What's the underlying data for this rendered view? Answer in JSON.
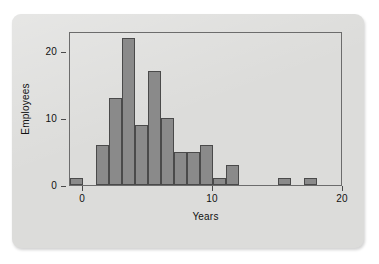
{
  "chart_data": {
    "type": "bar",
    "title": "",
    "subtitle": "",
    "xlabel": "Years",
    "ylabel": "Employees",
    "xlim": [
      -1,
      20
    ],
    "ylim": [
      0,
      23
    ],
    "grid": false,
    "legend": null,
    "bin_width": 1,
    "x_ticks": [
      {
        "value": 0,
        "label": "0"
      },
      {
        "value": 10,
        "label": "10"
      },
      {
        "value": 20,
        "label": "20"
      }
    ],
    "y_ticks": [
      {
        "value": 0,
        "label": "0"
      },
      {
        "value": 10,
        "label": "10"
      },
      {
        "value": 20,
        "label": "20"
      }
    ],
    "bins": [
      {
        "x0": -1,
        "x1": 0,
        "count": 1
      },
      {
        "x0": 1,
        "x1": 2,
        "count": 6
      },
      {
        "x0": 2,
        "x1": 3,
        "count": 13
      },
      {
        "x0": 3,
        "x1": 4,
        "count": 22
      },
      {
        "x0": 4,
        "x1": 5,
        "count": 9
      },
      {
        "x0": 5,
        "x1": 6,
        "count": 17
      },
      {
        "x0": 6,
        "x1": 7,
        "count": 10
      },
      {
        "x0": 7,
        "x1": 8,
        "count": 5
      },
      {
        "x0": 8,
        "x1": 9,
        "count": 5
      },
      {
        "x0": 9,
        "x1": 10,
        "count": 6
      },
      {
        "x0": 10,
        "x1": 11,
        "count": 1
      },
      {
        "x0": 11,
        "x1": 12,
        "count": 3
      },
      {
        "x0": 15,
        "x1": 16,
        "count": 1
      },
      {
        "x0": 17,
        "x1": 18,
        "count": 1
      }
    ],
    "categories": [
      "-1",
      "1",
      "2",
      "3",
      "4",
      "5",
      "6",
      "7",
      "8",
      "9",
      "10",
      "11",
      "15",
      "17"
    ],
    "values": [
      1,
      6,
      13,
      22,
      9,
      17,
      10,
      5,
      5,
      6,
      1,
      3,
      1,
      1
    ],
    "colors": {
      "bar_fill": "#8a8a8a",
      "bar_edge": "#4a4a4a",
      "axis": "#4a4a4a",
      "frame": "#6c6c6c",
      "card_background": "#dcdcda",
      "page_background": "#ffffff",
      "text": "#111111"
    }
  }
}
